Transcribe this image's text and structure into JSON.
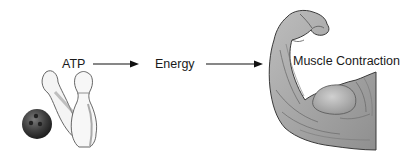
{
  "diagram": {
    "nodes": [
      {
        "id": "atp",
        "label": "ATP"
      },
      {
        "id": "energy",
        "label": "Energy"
      },
      {
        "id": "muscle",
        "label": "Muscle Contraction"
      }
    ],
    "edges": [
      {
        "from": "atp",
        "to": "energy"
      },
      {
        "from": "energy",
        "to": "muscle"
      }
    ],
    "illustrations": [
      "bowling-ball-and-pins",
      "flexed-arm-muscle"
    ]
  }
}
